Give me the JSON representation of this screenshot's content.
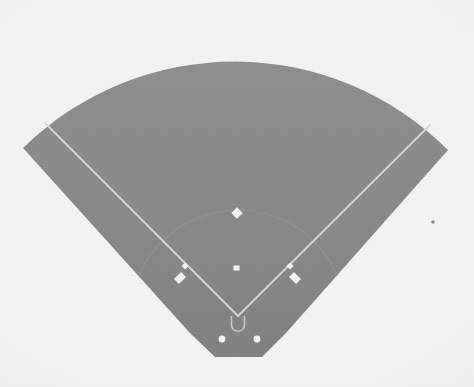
{
  "document": {
    "kind": "scanned-figure",
    "subject": "baseball-field-diagram",
    "title": "Baseball field layout diagram",
    "description": "Overhead plan view of a baseball diamond rendered as a gray fan-shaped playing surface on an off-white scanned page.",
    "caption": "",
    "has_text_labels": false
  },
  "canvas": {
    "width": 474,
    "height": 387
  },
  "colors": {
    "page_background": "#f4f3f1",
    "field_fill": "#8a8a8a",
    "field_fill_shadow": "#7f7f7f",
    "infield_dirt": "#8e8e8e",
    "line_white": "#e8e8e6",
    "line_white_soft": "#d8d8d5",
    "base_white": "#f2f2f0",
    "speck_dark": "#6d6b69"
  },
  "field": {
    "name": "playing-surface",
    "outfield_fence": {
      "shape": "arc",
      "crown_x": 238,
      "crown_y": 45,
      "left_corner_x": 23,
      "left_corner_y": 148,
      "right_corner_x": 448,
      "right_corner_y": 150
    },
    "backstop_edge": {
      "shape": "flat-trapezoid",
      "left_x": 215,
      "right_x": 262,
      "y": 357
    },
    "home_plate_apex": {
      "x": 238,
      "y": 318
    }
  },
  "markings": {
    "foul_lines": [
      {
        "name": "left-field-foul-line",
        "from_x": 238,
        "from_y": 316,
        "to_x": 45,
        "to_y": 123
      },
      {
        "name": "right-field-foul-line",
        "from_x": 238,
        "from_y": 316,
        "to_x": 430,
        "to_y": 125
      }
    ],
    "infield_arc": {
      "name": "infield-dirt-arc",
      "center_x": 238,
      "center_y": 318,
      "radius": 108,
      "visible": true,
      "contrast": "faint"
    },
    "batters_box": {
      "name": "batters-box-outline",
      "x": 238,
      "y": 322,
      "width": 13,
      "height": 9
    }
  },
  "bases": [
    {
      "name": "second-base",
      "x": 237,
      "y": 213,
      "size": 7,
      "shape": "diamond"
    },
    {
      "name": "third-base",
      "x": 185,
      "y": 266,
      "size": 5,
      "shape": "square"
    },
    {
      "name": "first-base",
      "x": 290,
      "y": 266,
      "size": 5,
      "shape": "square"
    },
    {
      "name": "pitchers-rubber",
      "x": 236,
      "y": 268,
      "size": 5,
      "shape": "rect"
    }
  ],
  "coachs_boxes": [
    {
      "name": "third-base-coachs-box",
      "x": 180,
      "y": 278,
      "width": 10,
      "height": 7,
      "rotation": -45
    },
    {
      "name": "first-base-coachs-box",
      "x": 295,
      "y": 278,
      "width": 10,
      "height": 7,
      "rotation": 45
    }
  ],
  "on_deck_circles": [
    {
      "name": "left-on-deck-circle",
      "x": 222,
      "y": 339,
      "radius": 3.4
    },
    {
      "name": "right-on-deck-circle",
      "x": 257,
      "y": 339,
      "radius": 3.4
    }
  ],
  "artifacts": [
    {
      "name": "scan-speck",
      "x": 433,
      "y": 222,
      "radius": 1.8
    }
  ]
}
